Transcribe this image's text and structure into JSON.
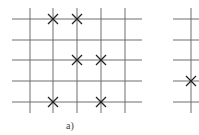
{
  "figure": {
    "panels": [
      {
        "id": "a",
        "caption": "a)",
        "caption_pos": {
          "x": 66,
          "y": 120
        },
        "grid": {
          "h_lines_y": [
            19,
            40,
            60,
            81,
            102
          ],
          "h_x1": 12,
          "h_x2": 142,
          "v_lines_x": [
            30,
            53,
            77,
            101,
            125
          ],
          "v_y1": 8,
          "v_y2": 113
        },
        "marks": [
          {
            "x": 53,
            "y": 19
          },
          {
            "x": 77,
            "y": 19
          },
          {
            "x": 77,
            "y": 60
          },
          {
            "x": 101,
            "y": 60
          },
          {
            "x": 53,
            "y": 102
          },
          {
            "x": 101,
            "y": 102
          }
        ]
      },
      {
        "id": "b-partial",
        "caption": "",
        "grid": {
          "h_lines_y": [
            19,
            40,
            60,
            81,
            102
          ],
          "h_x1": 173,
          "h_x2": 199,
          "v_lines_x": [
            191
          ],
          "v_y1": 8,
          "v_y2": 113
        },
        "marks": [
          {
            "x": 191,
            "y": 81
          }
        ]
      }
    ],
    "colors": {
      "line": "#6e6e6e",
      "mark": "#222222"
    }
  }
}
